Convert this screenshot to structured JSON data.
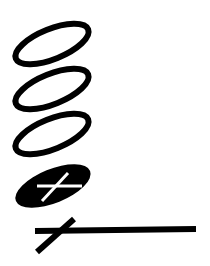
{
  "diagram": {
    "type": "symbol-notation",
    "caption": "",
    "colors": {
      "ink": "#000000",
      "paper": "#ffffff"
    },
    "symbols": [
      {
        "id": "open-ellipse-1",
        "kind": "open-ellipse",
        "cx": 52,
        "cy": 44,
        "rx": 39,
        "ry": 15,
        "rotate": -22,
        "stroke_width": 6
      },
      {
        "id": "open-ellipse-2",
        "kind": "open-ellipse",
        "cx": 52,
        "cy": 89,
        "rx": 39,
        "ry": 15,
        "rotate": -22,
        "stroke_width": 6
      },
      {
        "id": "open-ellipse-3",
        "kind": "open-ellipse",
        "cx": 52,
        "cy": 134,
        "rx": 39,
        "ry": 15,
        "rotate": -22,
        "stroke_width": 6
      },
      {
        "id": "filled-ellipse-with-cross",
        "kind": "filled-ellipse",
        "cx": 53,
        "cy": 186,
        "rx": 40,
        "ry": 17,
        "rotate": -22,
        "cross": {
          "h": [
            37,
            186,
            82,
            186
          ],
          "d": [
            42,
            201,
            68,
            173
          ],
          "stroke_width": 3,
          "color": "#ffffff"
        }
      },
      {
        "id": "cross-with-line",
        "kind": "crossed-line",
        "line": [
          35,
          231,
          196,
          229
        ],
        "line_width": 6,
        "diag": [
          37,
          252,
          74,
          219
        ],
        "diag_width": 6
      }
    ]
  }
}
